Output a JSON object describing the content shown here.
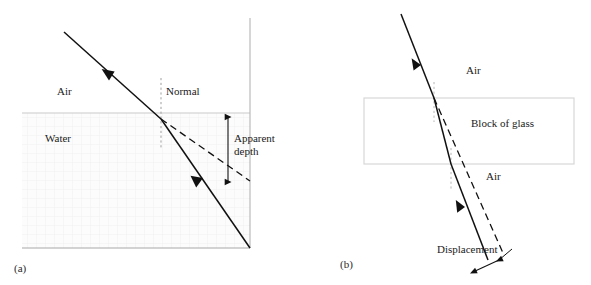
{
  "figure": {
    "panels": [
      {
        "tag": "(a)",
        "subject": "apparent depth",
        "labels": {
          "medium_upper": "Air",
          "medium_lower": "Water",
          "normal": "Normal",
          "measurement": "Apparent depth"
        },
        "colors": {
          "ray_solid": "#111111",
          "ray_dashed": "#111111",
          "normal_line": "#9a9a9a",
          "boundary": "#bdbdbd",
          "axis": "#a8a8a8",
          "water_fill": "#fbfbfb",
          "water_hatch": "#f0f0f0"
        }
      },
      {
        "tag": "(b)",
        "subject": "lateral displacement",
        "labels": {
          "medium_above": "Air",
          "medium_block": "Block of glass",
          "medium_below": "Air",
          "measurement": "Displacement"
        },
        "colors": {
          "ray_solid": "#111111",
          "ray_dashed": "#111111",
          "normal_line": "#b0b0b0",
          "block_border": "#d7d7d7",
          "block_fill": "#ffffff"
        }
      }
    ]
  }
}
